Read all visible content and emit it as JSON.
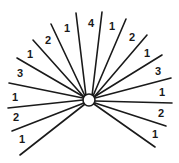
{
  "diagram": {
    "type": "radial-fan",
    "hub": {
      "cx": 89,
      "cy": 100,
      "r": 6
    },
    "color": "#1a1a1a",
    "rays": [
      {
        "x1": 86,
        "y1": 96,
        "x2": 76,
        "y2": 13
      },
      {
        "x1": 92,
        "y1": 96,
        "x2": 102,
        "y2": 12
      },
      {
        "x1": 85,
        "y1": 96,
        "x2": 51,
        "y2": 24
      },
      {
        "x1": 93,
        "y1": 96,
        "x2": 126,
        "y2": 19
      },
      {
        "x1": 84,
        "y1": 97,
        "x2": 33,
        "y2": 40
      },
      {
        "x1": 94,
        "y1": 97,
        "x2": 147,
        "y2": 35
      },
      {
        "x1": 84,
        "y1": 97,
        "x2": 17,
        "y2": 58
      },
      {
        "x1": 94,
        "y1": 97,
        "x2": 162,
        "y2": 55
      },
      {
        "x1": 83,
        "y1": 98,
        "x2": 9,
        "y2": 83
      },
      {
        "x1": 95,
        "y1": 98,
        "x2": 171,
        "y2": 78
      },
      {
        "x1": 83,
        "y1": 100,
        "x2": 8,
        "y2": 108
      },
      {
        "x1": 95,
        "y1": 101,
        "x2": 172,
        "y2": 103
      },
      {
        "x1": 84,
        "y1": 103,
        "x2": 12,
        "y2": 131
      },
      {
        "x1": 95,
        "y1": 103,
        "x2": 166,
        "y2": 126
      },
      {
        "x1": 85,
        "y1": 104,
        "x2": 20,
        "y2": 155
      },
      {
        "x1": 94,
        "y1": 104,
        "x2": 155,
        "y2": 147
      }
    ],
    "labels": [
      {
        "text": "4",
        "x": 91,
        "y": 24
      },
      {
        "text": "1",
        "x": 67,
        "y": 29
      },
      {
        "text": "2",
        "x": 48,
        "y": 41
      },
      {
        "text": "1",
        "x": 30,
        "y": 55
      },
      {
        "text": "3",
        "x": 20,
        "y": 74
      },
      {
        "text": "1",
        "x": 15,
        "y": 98
      },
      {
        "text": "2",
        "x": 16,
        "y": 118
      },
      {
        "text": "1",
        "x": 22,
        "y": 140
      },
      {
        "text": "1",
        "x": 112,
        "y": 27
      },
      {
        "text": "2",
        "x": 132,
        "y": 38
      },
      {
        "text": "1",
        "x": 147,
        "y": 54
      },
      {
        "text": "3",
        "x": 158,
        "y": 72
      },
      {
        "text": "1",
        "x": 162,
        "y": 93
      },
      {
        "text": "2",
        "x": 161,
        "y": 114
      },
      {
        "text": "1",
        "x": 155,
        "y": 135
      }
    ]
  }
}
